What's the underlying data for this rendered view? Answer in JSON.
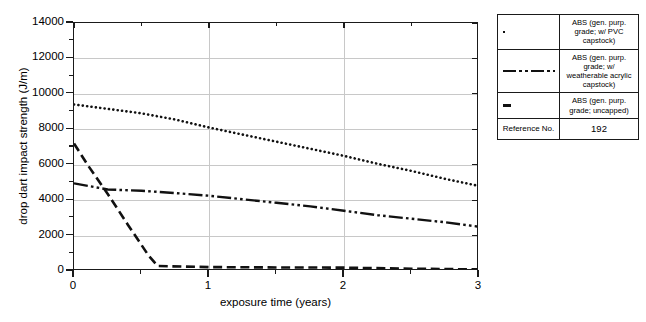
{
  "chart_data": {
    "type": "line",
    "title": "",
    "xlabel": "exposure time (years)",
    "ylabel": "drop dart impact strength (J/m)",
    "xlim": [
      0,
      3
    ],
    "ylim": [
      0,
      14000
    ],
    "xticks": [
      "0",
      "1",
      "2",
      "3"
    ],
    "xtick_values": [
      0,
      1,
      2,
      3
    ],
    "xtick_minor": [
      0.5,
      1.5,
      2.5
    ],
    "yticks": [
      "0",
      "2000",
      "4000",
      "6000",
      "8000",
      "10000",
      "12000",
      "14000"
    ],
    "ytick_values": [
      0,
      2000,
      4000,
      6000,
      8000,
      10000,
      12000,
      14000
    ],
    "ytick_minor": [
      1000,
      3000,
      5000,
      7000,
      9000,
      11000,
      13000
    ],
    "grid": true,
    "legend_position": "right-outside-table",
    "series": [
      {
        "name": "ABS (gen. purp. grade; w/ PVC capstock)",
        "style": "dotted",
        "color": "#111111",
        "x": [
          0,
          0.25,
          0.5,
          0.75,
          1.0,
          1.25,
          1.5,
          1.75,
          2.0,
          2.25,
          2.5,
          2.75,
          3.0
        ],
        "y": [
          9400,
          9150,
          8900,
          8550,
          8100,
          7700,
          7300,
          6900,
          6500,
          6050,
          5650,
          5200,
          4800
        ]
      },
      {
        "name": "ABS (gen. purp. grade; w/ weatherable acrylic capstock)",
        "style": "dash-dot-dot",
        "color": "#111111",
        "x": [
          0,
          0.25,
          0.5,
          0.75,
          1.0,
          1.25,
          1.5,
          1.75,
          2.0,
          2.25,
          2.5,
          2.75,
          3.0
        ],
        "y": [
          4950,
          4600,
          4530,
          4400,
          4250,
          4050,
          3850,
          3650,
          3400,
          3150,
          2950,
          2750,
          2500
        ]
      },
      {
        "name": "ABS (gen. purp. grade; uncapped)",
        "style": "dashed",
        "color": "#111111",
        "x": [
          0,
          0.1,
          0.25,
          0.4,
          0.55,
          0.62,
          1.0,
          1.5,
          2.0,
          2.5,
          3.0
        ],
        "y": [
          7200,
          6000,
          4350,
          2600,
          900,
          280,
          220,
          200,
          190,
          130,
          90
        ]
      }
    ]
  },
  "legend": {
    "rows": [
      {
        "swatch": "dotted",
        "text": "ABS (gen. purp. grade; w/ PVC capstock)"
      },
      {
        "swatch": "dash-dot-dot",
        "text": "ABS (gen. purp. grade; w/ weatherable acrylic capstock)"
      },
      {
        "swatch": "dashed",
        "text": "ABS (gen. purp. grade; uncapped)"
      }
    ],
    "reference_label": "Reference No.",
    "reference_value": "192"
  }
}
